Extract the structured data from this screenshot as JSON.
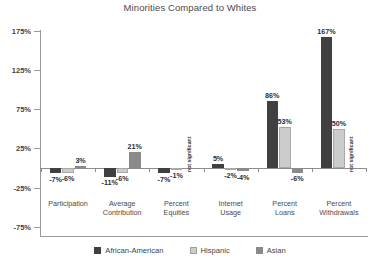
{
  "chart_data": {
    "type": "bar",
    "title": "Minorities Compared to Whites",
    "xlabel": "",
    "ylabel": "",
    "ylim": [
      -75,
      175
    ],
    "yticks": [
      175,
      125,
      75,
      25,
      -25,
      -75
    ],
    "ytick_labels": [
      "175%",
      "125%",
      "75%",
      "25%",
      "-25%",
      "-75%"
    ],
    "grid": false,
    "legend_position": "bottom",
    "categories": [
      "Participation",
      "Average\nContribution",
      "Percent\nEquities",
      "Internet\nUsage",
      "Percent\nLoans",
      "Percent\nWithdrawals"
    ],
    "series": [
      {
        "name": "African-American",
        "color": "#404040",
        "values": [
          -7,
          -11,
          -7,
          5,
          86,
          167
        ],
        "labels": [
          "-7%",
          "-11%",
          "-7%",
          "5%",
          "86%",
          "167%"
        ]
      },
      {
        "name": "Hispanic",
        "color": "#cccccc",
        "values": [
          -6,
          -6,
          -1,
          -2,
          53,
          50
        ],
        "labels": [
          "-6%",
          "-6%",
          "-1%",
          "-2%",
          "53%",
          "50%"
        ]
      },
      {
        "name": "Asian",
        "color": "#8a8a8a",
        "values": [
          3,
          21,
          null,
          -4,
          -6,
          null
        ],
        "labels": [
          "3%",
          "21%",
          "not significant",
          "-4%",
          "-6%",
          "not significant"
        ]
      }
    ],
    "annotations": [
      {
        "text": "not significant",
        "category": "Percent Equities",
        "series": "Asian"
      },
      {
        "text": "not significant",
        "category": "Percent Withdrawals",
        "series": "Asian"
      }
    ]
  },
  "legend": {
    "items": [
      {
        "label": "African-American"
      },
      {
        "label": "Hispanic"
      },
      {
        "label": "Asian"
      }
    ]
  }
}
